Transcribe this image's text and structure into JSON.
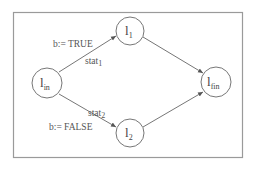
{
  "diagram": {
    "type": "control-flow-graph",
    "nodes": [
      {
        "id": "l_in",
        "label": "l",
        "subscript": "in"
      },
      {
        "id": "l_1",
        "label": "l",
        "subscript": "1"
      },
      {
        "id": "l_2",
        "label": "l",
        "subscript": "2"
      },
      {
        "id": "l_fin",
        "label": "l",
        "subscript": "fin"
      }
    ],
    "edges": [
      {
        "from": "l_in",
        "to": "l_1",
        "label": "b:= TRUE",
        "stat": "stat",
        "stat_sub": "1"
      },
      {
        "from": "l_in",
        "to": "l_2",
        "label": "b:= FALSE",
        "stat": "stat",
        "stat_sub": "2"
      },
      {
        "from": "l_1",
        "to": "l_fin"
      },
      {
        "from": "l_2",
        "to": "l_fin"
      }
    ]
  },
  "colors": {
    "frame": "#9a9a9a",
    "node_stroke": "#777777",
    "edge": "#666666",
    "text": "#555555"
  }
}
